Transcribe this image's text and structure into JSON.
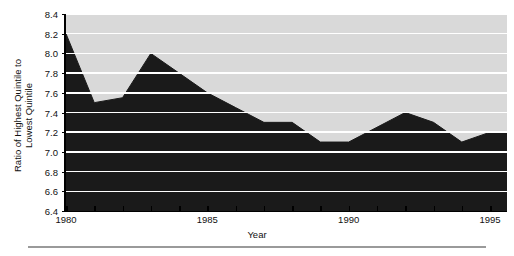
{
  "chart_data": {
    "type": "area",
    "title": "",
    "xlabel": "Year",
    "ylabel_line1": "Ratio of Highest Quintile to",
    "ylabel_line2": "Lowest Quintile",
    "x": [
      1980,
      1981,
      1982,
      1983,
      1984,
      1985,
      1986,
      1987,
      1988,
      1989,
      1990,
      1991,
      1992,
      1993,
      1994,
      1995
    ],
    "values": [
      8.2,
      7.5,
      7.55,
      8.0,
      7.8,
      7.6,
      7.45,
      7.3,
      7.3,
      7.1,
      7.1,
      7.25,
      7.4,
      7.3,
      7.1,
      7.2
    ],
    "xlim": [
      1980,
      1995.6
    ],
    "ylim": [
      6.4,
      8.4
    ],
    "xticks": [
      1980,
      1981,
      1982,
      1983,
      1984,
      1985,
      1986,
      1987,
      1988,
      1989,
      1990,
      1991,
      1992,
      1993,
      1994,
      1995
    ],
    "xticklabels": [
      "1980",
      "",
      "",
      "",
      "",
      "1985",
      "",
      "",
      "",
      "",
      "1990",
      "",
      "",
      "",
      "",
      "1995"
    ],
    "yticks": [
      6.4,
      6.6,
      6.8,
      7.0,
      7.2,
      7.4,
      7.6,
      7.8,
      8.0,
      8.2,
      8.4
    ],
    "yticklabels": [
      "6.4",
      "6.6",
      "6.8",
      "7.0",
      "7.2",
      "7.4",
      "7.6",
      "7.8",
      "8.0",
      "8.2",
      "8.4"
    ],
    "grid": true,
    "grid_color": "#ffffff",
    "plot_bgcolor": "#d9d9d9",
    "area_color": "#1a1a1a",
    "legend": "none"
  }
}
